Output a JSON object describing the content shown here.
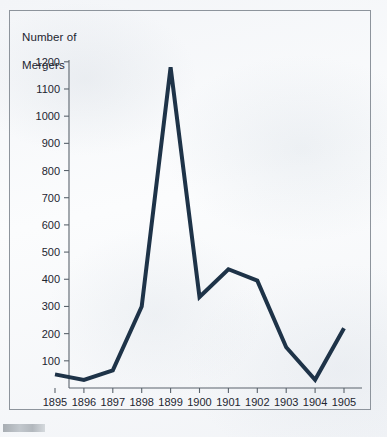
{
  "figure": {
    "title": "Number of\nMergers",
    "title_line1": "Number of",
    "title_line2": "Mergers",
    "border_color": "#8d949c",
    "background_color": "#f5f7f9"
  },
  "chart_data": {
    "type": "line",
    "title": "Number of Mergers",
    "xlabel": "",
    "ylabel": "Number of Mergers",
    "categories": [
      "1895",
      "1896",
      "1897",
      "1898",
      "1899",
      "1900",
      "1901",
      "1902",
      "1903",
      "1904",
      "1905"
    ],
    "x": [
      1895,
      1896,
      1897,
      1898,
      1899,
      1900,
      1901,
      1902,
      1903,
      1904,
      1905
    ],
    "values": [
      50,
      30,
      65,
      300,
      1180,
      335,
      437,
      395,
      150,
      30,
      220
    ],
    "series": [
      {
        "name": "Mergers",
        "values": [
          50,
          30,
          65,
          300,
          1180,
          335,
          437,
          395,
          150,
          30,
          220
        ],
        "color": "#1e3348"
      }
    ],
    "xlim": [
      1895,
      1905
    ],
    "ylim": [
      0,
      1250
    ],
    "ytick_values": [
      100,
      200,
      300,
      400,
      500,
      600,
      700,
      800,
      900,
      1000,
      1100,
      1200
    ],
    "ytick_labels": [
      "100",
      "200",
      "300",
      "400",
      "500",
      "600",
      "700",
      "800",
      "900",
      "1000",
      "1100",
      "1200"
    ],
    "xtick_labels": [
      "1895",
      "1896",
      "1897",
      "1898",
      "1899",
      "1900",
      "1901",
      "1902",
      "1903",
      "1904",
      "1905"
    ],
    "grid": false,
    "legend": null,
    "line_color": "#1e3348",
    "line_width": 4,
    "axis_color": "#5a636c"
  }
}
